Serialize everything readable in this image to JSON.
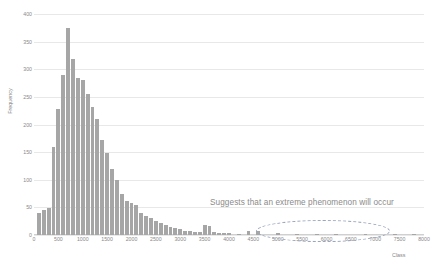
{
  "chart_data": {
    "type": "bar",
    "title": "",
    "subtitle": "",
    "xlabel": "Class",
    "ylabel": "Frequency",
    "xlim": [
      0,
      8000
    ],
    "ylim": [
      0,
      400
    ],
    "grid": true,
    "legend": null,
    "bar_color": "#a6a6a6",
    "bin_width": 100,
    "x_ticks": [
      0,
      500,
      1000,
      1500,
      2000,
      2500,
      3000,
      3500,
      4000,
      4500,
      5000,
      5500,
      6000,
      6500,
      7000,
      7500,
      8000
    ],
    "x_tick_labels": [
      "0",
      "500",
      "1000",
      "1500",
      "2000",
      "2500",
      "3000",
      "3500",
      "4000",
      "4500",
      "5000",
      "5500",
      "6000",
      "6500",
      "7000",
      "7500",
      "8000"
    ],
    "y_ticks": [
      0,
      50,
      100,
      150,
      200,
      250,
      300,
      350,
      400
    ],
    "y_tick_labels": [
      "0",
      "50",
      "100",
      "150",
      "200",
      "250",
      "300",
      "350",
      "400"
    ],
    "categories": [
      100,
      200,
      300,
      400,
      500,
      600,
      700,
      800,
      900,
      1000,
      1100,
      1200,
      1300,
      1400,
      1500,
      1600,
      1700,
      1800,
      1900,
      2000,
      2100,
      2200,
      2300,
      2400,
      2500,
      2600,
      2700,
      2800,
      2900,
      3000,
      3100,
      3200,
      3300,
      3400,
      3500,
      3600,
      3700,
      3800,
      3900,
      4000,
      4200,
      4400,
      4600,
      5000,
      5400,
      5800,
      6200,
      6800,
      7400,
      7800
    ],
    "values": [
      40,
      45,
      48,
      160,
      228,
      290,
      375,
      318,
      285,
      280,
      255,
      232,
      210,
      172,
      148,
      120,
      100,
      75,
      62,
      58,
      55,
      40,
      35,
      30,
      26,
      22,
      18,
      15,
      12,
      10,
      8,
      7,
      6,
      5,
      18,
      16,
      5,
      4,
      3,
      3,
      2,
      8,
      7,
      3,
      2,
      2,
      2,
      2,
      1,
      1
    ],
    "annotations": [
      {
        "name": "extreme-phenomenon-note",
        "text": "Suggests that an extreme phenomenon will occur",
        "shape": "dashed-ellipse",
        "x_range": [
          5000,
          7500
        ],
        "y_range": [
          0,
          20
        ]
      }
    ]
  }
}
